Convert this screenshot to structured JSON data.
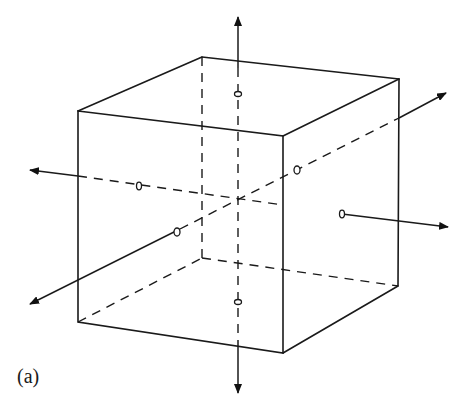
{
  "figure": {
    "caption": "(a)",
    "colors": {
      "line": "#1a1a1a",
      "background": "#ffffff"
    }
  },
  "cube": {
    "front_face": [
      [
        78,
        111
      ],
      [
        283,
        136
      ],
      [
        283,
        353
      ],
      [
        78,
        322
      ]
    ],
    "back_face": [
      [
        202,
        57
      ],
      [
        399,
        79
      ],
      [
        398,
        286
      ],
      [
        202,
        258
      ]
    ],
    "center": [
      238,
      200
    ]
  },
  "axes": [
    {
      "name": "vertical-axis",
      "from": [
        238,
        25
      ],
      "to": [
        238,
        392
      ],
      "markers": [
        [
          238,
          94
        ],
        [
          238,
          302
        ]
      ]
    },
    {
      "name": "horizontal-axis",
      "from": [
        30,
        170
      ],
      "to": [
        448,
        227
      ],
      "markers": [
        [
          139,
          186
        ],
        [
          342,
          214
        ]
      ]
    },
    {
      "name": "depth-axis",
      "from": [
        30,
        304
      ],
      "to": [
        445,
        93
      ],
      "markers": [
        [
          177,
          232
        ],
        [
          297,
          170
        ]
      ]
    }
  ]
}
